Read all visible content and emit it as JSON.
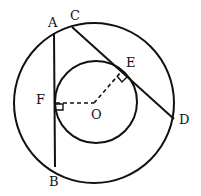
{
  "diagram": {
    "type": "geometry",
    "labels": {
      "A": "A",
      "B": "B",
      "C": "C",
      "D": "D",
      "E": "E",
      "F": "F",
      "O": "O"
    },
    "stroke_color": "#111111"
  }
}
